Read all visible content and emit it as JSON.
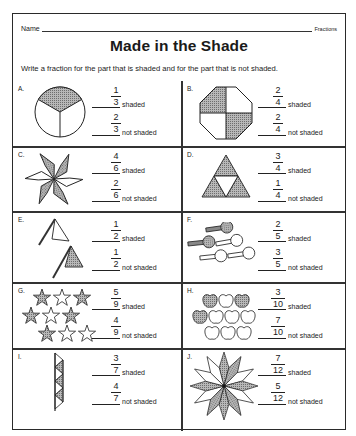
{
  "header": {
    "name_label": "Name",
    "subject": "Fractions",
    "title": "Made in the Shade",
    "instructions": "Write a fraction for the part that is shaded and for the part that is not shaded."
  },
  "labels": {
    "shaded": "shaded",
    "not_shaded": "not shaded"
  },
  "problems": [
    {
      "letter": "A.",
      "shape": "circle-thirds",
      "shaded": {
        "num": "1",
        "den": "3"
      },
      "not_shaded": {
        "num": "2",
        "den": "3"
      }
    },
    {
      "letter": "B.",
      "shape": "octagon-quarters",
      "shaded": {
        "num": "2",
        "den": "4"
      },
      "not_shaded": {
        "num": "2",
        "den": "4"
      }
    },
    {
      "letter": "C.",
      "shape": "six-rhombus-star",
      "shaded": {
        "num": "4",
        "den": "6"
      },
      "not_shaded": {
        "num": "2",
        "den": "6"
      }
    },
    {
      "letter": "D.",
      "shape": "triangle-quarters",
      "shaded": {
        "num": "3",
        "den": "4"
      },
      "not_shaded": {
        "num": "1",
        "den": "4"
      }
    },
    {
      "letter": "E.",
      "shape": "two-flags",
      "shaded": {
        "num": "1",
        "den": "2"
      },
      "not_shaded": {
        "num": "1",
        "den": "2"
      }
    },
    {
      "letter": "F.",
      "shape": "five-keys",
      "shaded": {
        "num": "2",
        "den": "5"
      },
      "not_shaded": {
        "num": "3",
        "den": "5"
      }
    },
    {
      "letter": "G.",
      "shape": "nine-stars",
      "shaded": {
        "num": "5",
        "den": "9"
      },
      "not_shaded": {
        "num": "4",
        "den": "9"
      }
    },
    {
      "letter": "H.",
      "shape": "ten-apples",
      "shaded": {
        "num": "3",
        "den": "10"
      },
      "not_shaded": {
        "num": "7",
        "den": "10"
      }
    },
    {
      "letter": "I.",
      "shape": "seven-triangle-strip",
      "shaded": {
        "num": "3",
        "den": "7"
      },
      "not_shaded": {
        "num": "4",
        "den": "7"
      }
    },
    {
      "letter": "J.",
      "shape": "twelve-petal-star",
      "shaded": {
        "num": "7",
        "den": "12"
      },
      "not_shaded": {
        "num": "5",
        "den": "12"
      }
    }
  ],
  "colors": {
    "ink": "#1a1a1a",
    "shade": "#9a9a9a",
    "paper": "#ffffff"
  }
}
